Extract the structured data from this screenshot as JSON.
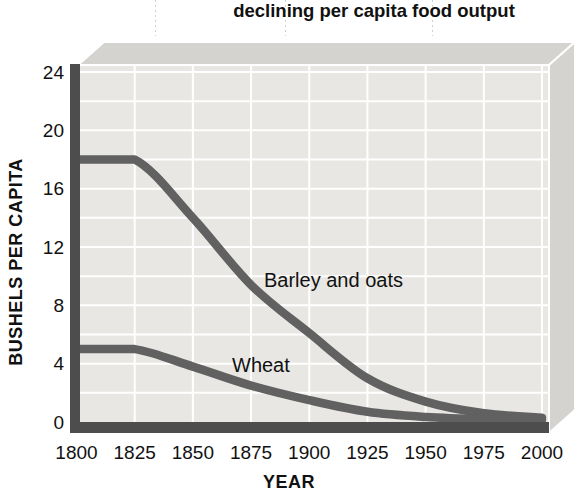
{
  "figure": {
    "title": "declining per capita food output"
  },
  "chart_data": {
    "type": "line",
    "title": "declining per capita food output",
    "xlabel": "YEAR",
    "ylabel": "BUSHELS PER CAPITA",
    "x": [
      1800,
      1825,
      1850,
      1875,
      1900,
      1925,
      1950,
      1975,
      2000
    ],
    "x_ticks": [
      1800,
      1825,
      1850,
      1875,
      1900,
      1925,
      1950,
      1975,
      2000
    ],
    "y_ticks": [
      0,
      4,
      8,
      12,
      16,
      20,
      24
    ],
    "xlim": [
      1800,
      2000
    ],
    "ylim": [
      0,
      24
    ],
    "grid": true,
    "y_minor_step": 2,
    "x_grid_step": 25,
    "legend_position": "inline-labels",
    "style": "3d-slab",
    "series": [
      {
        "name": "Barley and oats",
        "values": [
          18,
          18,
          14,
          9.4,
          6.1,
          3.0,
          1.4,
          0.6,
          0.3
        ],
        "color": "#616161"
      },
      {
        "name": "Wheat",
        "values": [
          5,
          5,
          3.8,
          2.5,
          1.5,
          0.7,
          0.35,
          0.2,
          0.15
        ],
        "color": "#616161"
      }
    ]
  },
  "colors": {
    "background": "#ffffff",
    "plot_face": "#e9e7e4",
    "panel_face": "#d5d3d0",
    "gridline": "#ffffff",
    "axis_bar": "#4d4d4d",
    "curve": "#616161",
    "text": "#111111"
  }
}
